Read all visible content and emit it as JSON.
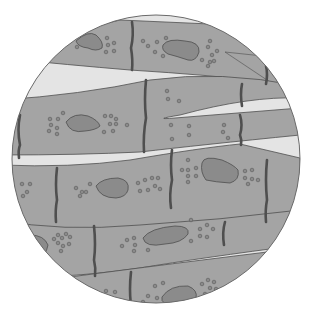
{
  "figure": {
    "view": "circular field of view",
    "colors": {
      "background": "#ffffff",
      "gap": "#e4e4e4",
      "fiber": "#a4a4a4",
      "nucleus": "#8b8b8b",
      "outline": "#4f4f4f",
      "disc": "#5a5a5a",
      "granule": "#8a8a8a"
    },
    "circle": {
      "cx": 156,
      "cy": 159,
      "r": 144
    }
  }
}
